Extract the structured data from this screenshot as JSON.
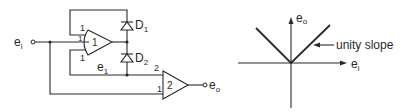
{
  "circuit": {
    "input_label": "e",
    "input_sub": "i",
    "output_label": "e",
    "output_sub": "o",
    "node_label": "e",
    "node_sub": "1",
    "amp1": {
      "name": "1",
      "top_input_pin": "1",
      "side_input_pin": "1",
      "bottom_input_pin": "1"
    },
    "amp2": {
      "name": "2",
      "input_pin_top": "2",
      "input_pin_bottom": "1"
    },
    "diode1": {
      "label": "D",
      "sub": "1"
    },
    "diode2": {
      "label": "D",
      "sub": "2"
    }
  },
  "graph": {
    "y_axis_label": "e",
    "y_axis_sub": "o",
    "x_axis_label": "e",
    "x_axis_sub": "i",
    "annotation": "unity slope",
    "colors": {
      "ink": "#2a2a2a",
      "background": "#ffffff"
    }
  }
}
